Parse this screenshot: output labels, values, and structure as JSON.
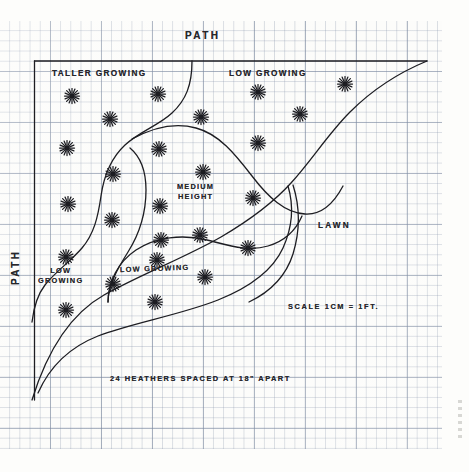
{
  "document": {
    "title": "Heather garden bed planting plan on graph paper",
    "paper": "graph-paper",
    "ink_color": "#26262b"
  },
  "labels": {
    "path_top": "PATH",
    "path_left": "PATH",
    "taller_growing": "TALLER GROWING",
    "low_growing_top": "LOW GROWING",
    "medium_height_line1": "MEDIUM",
    "medium_height_line2": "HEIGHT",
    "lawn": "LAWN",
    "low_growing_left_line1": "LOW",
    "low_growing_left_line2": "GROWING",
    "low_growing_mid": "LOW GROWING",
    "scale": "SCALE 1CM = 1FT.",
    "caption": "24 HEATHERS SPACED AT 18\" APART"
  },
  "plan": {
    "bed_border": {
      "left_x": 34,
      "top_y": 61,
      "right_x": 427,
      "bottom_open": true
    },
    "heathers": [
      {
        "id": 1,
        "x": 72,
        "y": 96,
        "zone": "taller-growing"
      },
      {
        "id": 2,
        "x": 158,
        "y": 94,
        "zone": "taller-growing"
      },
      {
        "id": 3,
        "x": 110,
        "y": 119,
        "zone": "taller-growing"
      },
      {
        "id": 4,
        "x": 67,
        "y": 148,
        "zone": "taller-growing"
      },
      {
        "id": 5,
        "x": 113,
        "y": 174,
        "zone": "taller-growing"
      },
      {
        "id": 6,
        "x": 68,
        "y": 204,
        "zone": "taller-growing"
      },
      {
        "id": 7,
        "x": 112,
        "y": 220,
        "zone": "taller-growing"
      },
      {
        "id": 8,
        "x": 160,
        "y": 206,
        "zone": "medium-height"
      },
      {
        "id": 9,
        "x": 201,
        "y": 117,
        "zone": "medium-height"
      },
      {
        "id": 10,
        "x": 159,
        "y": 149,
        "zone": "medium-height"
      },
      {
        "id": 11,
        "x": 203,
        "y": 172,
        "zone": "medium-height"
      },
      {
        "id": 12,
        "x": 161,
        "y": 240,
        "zone": "medium-height"
      },
      {
        "id": 13,
        "x": 200,
        "y": 235,
        "zone": "medium-height"
      },
      {
        "id": 14,
        "x": 258,
        "y": 92,
        "zone": "low-growing-top"
      },
      {
        "id": 15,
        "x": 300,
        "y": 114,
        "zone": "low-growing-top"
      },
      {
        "id": 16,
        "x": 345,
        "y": 84,
        "zone": "low-growing-top"
      },
      {
        "id": 17,
        "x": 258,
        "y": 143,
        "zone": "low-growing-top"
      },
      {
        "id": 18,
        "x": 253,
        "y": 198,
        "zone": "low-growing-top"
      },
      {
        "id": 19,
        "x": 66,
        "y": 257,
        "zone": "low-growing-left"
      },
      {
        "id": 20,
        "x": 66,
        "y": 310,
        "zone": "low-growing-left"
      },
      {
        "id": 21,
        "x": 113,
        "y": 284,
        "zone": "low-growing-mid"
      },
      {
        "id": 22,
        "x": 157,
        "y": 260,
        "zone": "low-growing-mid"
      },
      {
        "id": 23,
        "x": 205,
        "y": 277,
        "zone": "low-growing-mid"
      },
      {
        "id": 24,
        "x": 155,
        "y": 302,
        "zone": "low-growing-mid"
      },
      {
        "id": 25,
        "x": 248,
        "y": 248,
        "zone": "low-growing-mid"
      }
    ]
  },
  "meta": {
    "heather_count": "24",
    "spacing": "18\"",
    "scale_ratio": "1CM = 1FT."
  }
}
